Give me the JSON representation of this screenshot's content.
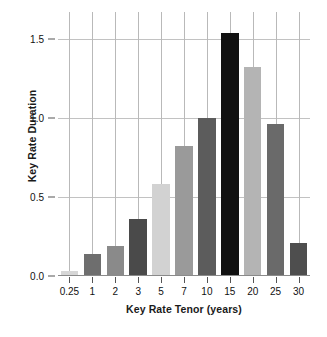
{
  "chart_data": {
    "type": "bar",
    "title": "",
    "xlabel": "Key Rate Tenor (years)",
    "ylabel": "Key Rate Duration",
    "categories": [
      "0.25",
      "1",
      "2",
      "3",
      "5",
      "7",
      "10",
      "15",
      "20",
      "25",
      "30"
    ],
    "values": [
      0.03,
      0.14,
      0.19,
      0.36,
      0.58,
      0.82,
      1.0,
      1.54,
      1.32,
      0.96,
      0.21
    ],
    "bar_colors": [
      "#d6d6d6",
      "#6e6e6e",
      "#8a8a8a",
      "#4a4a4a",
      "#d2d2d2",
      "#9a9a9a",
      "#5c5c5c",
      "#111111",
      "#b4b4b4",
      "#6a6a6a",
      "#4e4e4e"
    ],
    "ylim": [
      0.0,
      1.67
    ],
    "yticks": [
      "0.0",
      "0.5",
      "1.0",
      "1.5"
    ],
    "ytick_values": [
      0.0,
      0.5,
      1.0,
      1.5
    ],
    "xtick_labels": [
      "0.25",
      "1",
      "2",
      "3",
      "5",
      "7",
      "10",
      "15",
      "20",
      "25",
      "30"
    ],
    "grid": "vertical-and-horizontal",
    "legend": "none",
    "gridline_color": "#b9b9b9",
    "axis_color": "#555555",
    "background": "#ffffff"
  }
}
